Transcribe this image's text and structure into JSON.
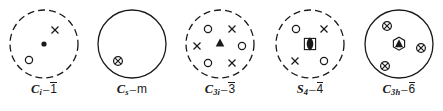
{
  "figure": {
    "type": "crystallographic-point-group-stereograms",
    "count": 5
  },
  "groups": [
    {
      "id": "ci",
      "schoenflies_main": "C",
      "schoenflies_sub": "i",
      "dash": "–",
      "hermann_mauguin": "1",
      "hermann_mauguin_barred": true,
      "circle_style": "dashed",
      "center_symbol": "filled-dot",
      "points": [
        {
          "symbol": "cross",
          "x": 47,
          "y": 22
        },
        {
          "symbol": "circle",
          "x": 21,
          "y": 52
        }
      ]
    },
    {
      "id": "cs",
      "schoenflies_main": "C",
      "schoenflies_sub": "s",
      "dash": "–",
      "hermann_mauguin": "m",
      "hermann_mauguin_barred": false,
      "circle_style": "solid",
      "center_symbol": "none",
      "points": [
        {
          "symbol": "circle-cross",
          "x": 22,
          "y": 53
        }
      ]
    },
    {
      "id": "c3i",
      "schoenflies_main": "C",
      "schoenflies_sub": "3i",
      "dash": "–",
      "hermann_mauguin": "3",
      "hermann_mauguin_barred": true,
      "circle_style": "dashed",
      "center_symbol": "filled-triangle",
      "points": [
        {
          "symbol": "circle",
          "x": 24,
          "y": 21
        },
        {
          "symbol": "cross",
          "x": 48,
          "y": 21
        },
        {
          "symbol": "cross",
          "x": 13,
          "y": 38
        },
        {
          "symbol": "circle",
          "x": 58,
          "y": 38
        },
        {
          "symbol": "circle",
          "x": 24,
          "y": 55
        },
        {
          "symbol": "cross",
          "x": 48,
          "y": 55
        }
      ]
    },
    {
      "id": "s4",
      "schoenflies_main": "S",
      "schoenflies_sub": "4",
      "dash": "–",
      "hermann_mauguin": "4",
      "hermann_mauguin_barred": true,
      "circle_style": "dashed",
      "center_symbol": "s4-lens",
      "points": [
        {
          "symbol": "circle",
          "x": 22,
          "y": 21
        },
        {
          "symbol": "cross",
          "x": 50,
          "y": 21
        },
        {
          "symbol": "cross",
          "x": 21,
          "y": 53
        },
        {
          "symbol": "circle",
          "x": 50,
          "y": 53
        }
      ]
    },
    {
      "id": "c3h",
      "schoenflies_main": "C",
      "schoenflies_sub": "3h",
      "dash": "–",
      "hermann_mauguin": "6",
      "hermann_mauguin_barred": true,
      "circle_style": "solid",
      "center_symbol": "hexagon-triangle",
      "points": [
        {
          "symbol": "circle-cross",
          "x": 24,
          "y": 18
        },
        {
          "symbol": "circle-cross",
          "x": 58,
          "y": 40
        },
        {
          "symbol": "circle-cross",
          "x": 22,
          "y": 58
        }
      ]
    }
  ],
  "colors": {
    "ink": "#1a1a1a",
    "background": "#ffffff"
  }
}
